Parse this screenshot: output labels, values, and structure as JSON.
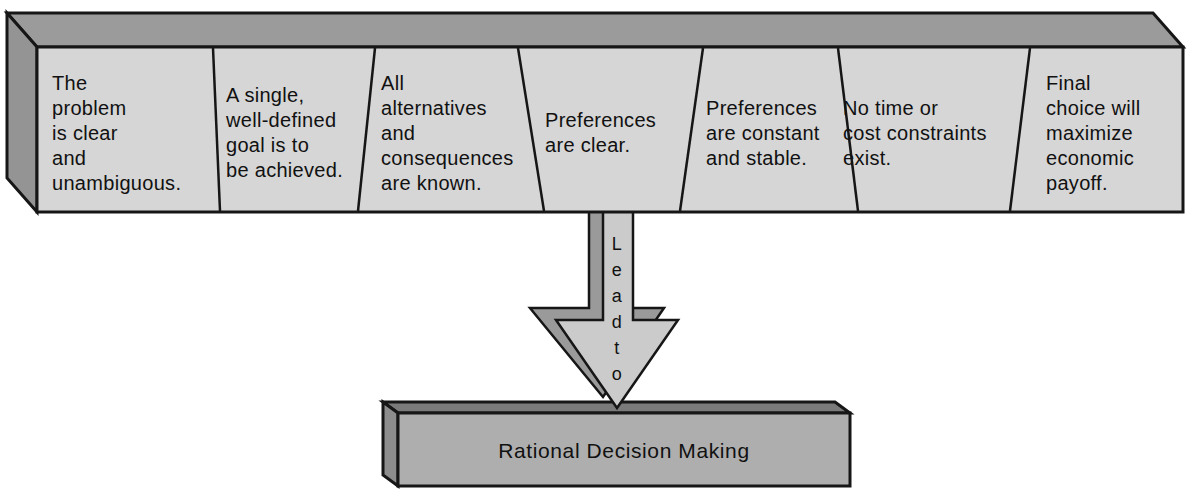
{
  "beam": {
    "front_color": "#d6d6d6",
    "top_color": "#9b9b9b",
    "side_color": "#949494",
    "segments": [
      {
        "text": "The\nproblem\nis clear\nand\nunambiguous."
      },
      {
        "text": "A single,\nwell-defined\ngoal is to\nbe achieved."
      },
      {
        "text": "All\nalternatives\nand\nconsequences\nare known."
      },
      {
        "text": "Preferences\nare clear."
      },
      {
        "text": "Preferences\nare constant\nand stable."
      },
      {
        "text": "No time or\ncost constraints\nexist."
      },
      {
        "text": "Final\nchoice will\nmaximize\neconomic\npayoff."
      }
    ]
  },
  "arrow": {
    "label": "Lead to",
    "label_stacked": "L\ne\na\nd\nt\no",
    "front_color": "#cbcbcb",
    "bevel_color": "#9a9a9a"
  },
  "result_box": {
    "label": "Rational Decision Making",
    "front_color": "#aeaeae",
    "top_color": "#7a7a7a",
    "side_color": "#8d8d8d"
  },
  "colors": {
    "background": "#ffffff",
    "outline": "#161616",
    "text": "#111111"
  }
}
